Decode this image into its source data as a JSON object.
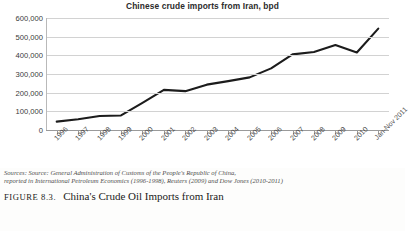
{
  "chart_data": {
    "type": "line",
    "title": "Chinese crude imports from Iran, bpd",
    "xlabel": "",
    "ylabel": "",
    "ylim": [
      0,
      600000
    ],
    "ytick_values": [
      0,
      100000,
      200000,
      300000,
      400000,
      500000,
      600000
    ],
    "ytick_labels": [
      "0",
      "100,000",
      "200,000",
      "300,000",
      "400,000",
      "500,000",
      "600,000"
    ],
    "grid": true,
    "legend": "none",
    "line_color": "#1c1c1c",
    "categories": [
      "1996",
      "1997",
      "1998",
      "1999",
      "2000",
      "2001",
      "2002",
      "2003",
      "2004",
      "2005",
      "2006",
      "2007",
      "2008",
      "2009",
      "2010",
      "Jan-Nov 2011"
    ],
    "values": [
      45000,
      58000,
      75000,
      78000,
      145000,
      215000,
      208000,
      243000,
      262000,
      282000,
      330000,
      405000,
      418000,
      455000,
      415000,
      543000
    ],
    "series": [
      {
        "name": "Chinese crude imports from Iran, bpd",
        "values": [
          45000,
          58000,
          75000,
          78000,
          145000,
          215000,
          208000,
          243000,
          262000,
          282000,
          330000,
          405000,
          418000,
          455000,
          415000,
          543000
        ]
      }
    ]
  },
  "sources": {
    "line1": "Sources: Source: General Administration of Customs of the People's Republic of China,",
    "line2": "reported in International Petroleum Economics (1996-1998), Reuters (2009) and Dow Jones (2010-2011)"
  },
  "caption": {
    "figure_label": "Figure 8.3.",
    "text": "China's Crude Oil Imports from Iran"
  }
}
